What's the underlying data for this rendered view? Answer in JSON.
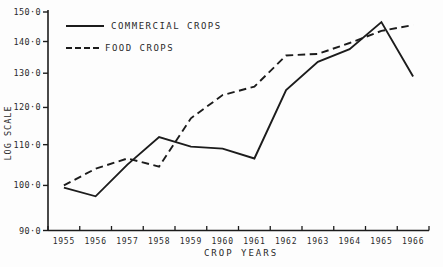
{
  "chart": {
    "ylabel": "LOG SCALE",
    "xlabel": "CROP YEARS",
    "legend": [
      {
        "label": "COMMERCIAL CROPS",
        "style": "solid"
      },
      {
        "label": "FOOD CROPS",
        "style": "dashed"
      }
    ],
    "line_color": "#1c1c1c",
    "text_color": "#2a2a2a",
    "background_color": "#fdfdfd"
  },
  "chart_data": {
    "type": "line",
    "title": "",
    "xlabel": "CROP YEARS",
    "ylabel": "LOG SCALE",
    "y_scale": "log",
    "ylim": [
      90,
      150
    ],
    "yticks": [
      90,
      100,
      110,
      120,
      130,
      140,
      150
    ],
    "ytick_labels": [
      "90·0",
      "100·0",
      "110·0",
      "120·0",
      "130·0",
      "140·0",
      "150·0"
    ],
    "categories": [
      "1955",
      "1956",
      "1957",
      "1958",
      "1959",
      "1960",
      "1961",
      "1962",
      "1963",
      "1964",
      "1965",
      "1966"
    ],
    "series": [
      {
        "name": "COMMERCIAL CROPS",
        "style": "solid",
        "values": [
          99.5,
          97.5,
          105,
          112,
          109.5,
          109,
          106.5,
          125,
          133.5,
          137.5,
          146.5,
          129
        ]
      },
      {
        "name": "FOOD CROPS",
        "style": "dashed",
        "values": [
          100,
          104,
          106.5,
          104.5,
          117,
          123.5,
          126,
          135.5,
          136,
          139.5,
          143.5,
          145.5
        ]
      }
    ],
    "legend_position": "top-left",
    "grid": false
  }
}
